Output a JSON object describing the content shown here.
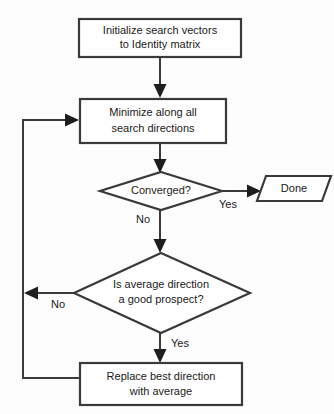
{
  "diagram": {
    "type": "flowchart",
    "background_color": "#fdfdfd",
    "line_color": "#3a3a3a",
    "text_color": "#1a1a1a",
    "fill_color": "#ffffff",
    "nodes": [
      {
        "id": "init",
        "shape": "rectangle",
        "lines": [
          "Initialize search vectors",
          "to Identity matrix"
        ]
      },
      {
        "id": "minimize",
        "shape": "rectangle",
        "lines": [
          "Minimize along all",
          "search directions"
        ]
      },
      {
        "id": "converged",
        "shape": "diamond",
        "lines": [
          "Converged?"
        ]
      },
      {
        "id": "done",
        "shape": "parallelogram",
        "lines": [
          "Done"
        ]
      },
      {
        "id": "prospect",
        "shape": "diamond",
        "lines": [
          "Is average direction",
          "a good prospect?"
        ]
      },
      {
        "id": "replace",
        "shape": "rectangle",
        "lines": [
          "Replace best direction",
          "with average"
        ]
      }
    ],
    "edge_labels": {
      "converged_yes": "Yes",
      "converged_no": "No",
      "prospect_no": "No",
      "prospect_yes": "Yes"
    }
  }
}
